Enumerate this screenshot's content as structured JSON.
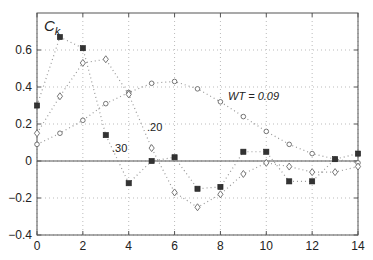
{
  "chart_data": {
    "type": "line",
    "title": "",
    "xlabel": "",
    "ylabel": "C_k",
    "xlim": [
      0,
      14
    ],
    "ylim": [
      -0.4,
      0.8
    ],
    "xticks": [
      0,
      2,
      4,
      6,
      8,
      10,
      12,
      14
    ],
    "yticks": [
      -0.4,
      -0.2,
      0,
      0.2,
      0.4,
      0.6
    ],
    "ytick_labels": [
      "−0.4",
      "−0.2",
      "0",
      "0.2",
      "0.4",
      "0.6"
    ],
    "grid": true,
    "x": [
      0,
      1,
      2,
      3,
      4,
      5,
      6,
      7,
      8,
      9,
      10,
      11,
      12,
      13,
      14
    ],
    "series": [
      {
        "name": "WT = 0.09",
        "marker": "circle",
        "values": [
          0.09,
          0.15,
          0.22,
          0.31,
          0.37,
          0.42,
          0.43,
          0.39,
          0.32,
          0.24,
          0.16,
          0.09,
          0.04,
          0.01,
          -0.01
        ]
      },
      {
        "name": ".20",
        "marker": "diamond",
        "values": [
          0.15,
          0.35,
          0.53,
          0.55,
          0.36,
          0.07,
          -0.17,
          -0.25,
          -0.18,
          -0.07,
          -0.01,
          -0.03,
          -0.06,
          -0.06,
          -0.03
        ]
      },
      {
        "name": ".30",
        "marker": "square",
        "values": [
          0.3,
          0.67,
          0.61,
          0.14,
          -0.12,
          0.0,
          0.02,
          -0.15,
          -0.14,
          0.05,
          0.05,
          -0.11,
          -0.11,
          0.01,
          0.04
        ]
      }
    ],
    "annotations": [
      {
        "text": "WT = 0.09",
        "x": 8.5,
        "y": 0.35
      },
      {
        "text": ".20",
        "x": 4.9,
        "y": 0.18
      },
      {
        "text": ".30",
        "x": 3.5,
        "y": 0.06
      }
    ]
  },
  "labels": {
    "ylabel_main": "C",
    "ylabel_sub": "k",
    "wt_label": "WT = 0.09",
    "label_20": ".20",
    "label_30": ".30"
  }
}
